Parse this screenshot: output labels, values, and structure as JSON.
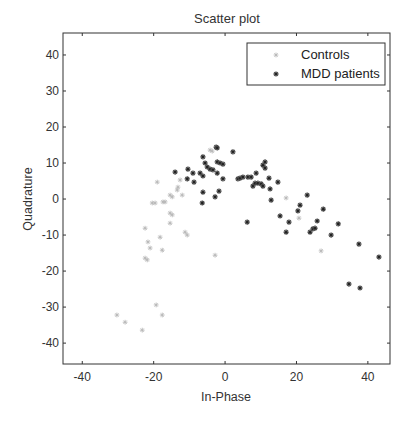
{
  "chart_data": {
    "type": "scatter",
    "title": "Scatter plot",
    "xlabel": "In-Phase",
    "ylabel": "Quadrature",
    "xlim": [
      -45.4,
      46.2
    ],
    "ylim": [
      -45.8,
      46.1
    ],
    "xticks": [
      -40,
      -20,
      0,
      20,
      40
    ],
    "yticks": [
      40,
      30,
      20,
      10,
      0,
      -10,
      -20,
      -30,
      -40
    ],
    "grid": false,
    "legend_position": "upper right",
    "series": [
      {
        "name": "Controls",
        "marker": "light-gray-star",
        "color": "#b8b8b8",
        "points": [
          [
            -19.0,
            4.7
          ],
          [
            -12.6,
            5.3
          ],
          [
            -13.2,
            3.3
          ],
          [
            -13.4,
            2.5
          ],
          [
            -15.4,
            1.1
          ],
          [
            -14.8,
            0.6
          ],
          [
            -12.0,
            1.1
          ],
          [
            -17.4,
            -0.8
          ],
          [
            -20.4,
            -1.1
          ],
          [
            -19.6,
            -1.1
          ],
          [
            -16.8,
            -0.8
          ],
          [
            -15.4,
            -3.9
          ],
          [
            -14.8,
            -4.4
          ],
          [
            -15.4,
            -6.7
          ],
          [
            -22.4,
            -8.1
          ],
          [
            -18.2,
            -10.6
          ],
          [
            -11.2,
            -9.2
          ],
          [
            -10.6,
            -10.0
          ],
          [
            -21.6,
            -11.9
          ],
          [
            -21.0,
            -13.6
          ],
          [
            -17.6,
            -14.2
          ],
          [
            -22.4,
            -16.4
          ],
          [
            -21.8,
            -16.9
          ],
          [
            -19.3,
            -29.4
          ],
          [
            -17.6,
            -32.2
          ],
          [
            -30.3,
            -32.2
          ],
          [
            -28.0,
            -34.2
          ],
          [
            -23.2,
            -36.4
          ],
          [
            -2.8,
            -15.6
          ],
          [
            -4.2,
            13.6
          ],
          [
            -3.6,
            13.3
          ],
          [
            17.1,
            0.3
          ],
          [
            20.7,
            -5.3
          ],
          [
            26.9,
            -14.4
          ]
        ]
      },
      {
        "name": "MDD patients",
        "marker": "dark-gray-star",
        "color": "#4a4a4a",
        "points": [
          [
            -14.0,
            7.5
          ],
          [
            -10.4,
            8.3
          ],
          [
            -10.6,
            5.6
          ],
          [
            -9.0,
            7.2
          ],
          [
            -8.7,
            4.7
          ],
          [
            -7.0,
            7.2
          ],
          [
            -6.2,
            6.4
          ],
          [
            -6.2,
            11.7
          ],
          [
            -5.6,
            10.0
          ],
          [
            -5.0,
            8.9
          ],
          [
            -4.2,
            8.3
          ],
          [
            -3.4,
            8.1
          ],
          [
            -2.5,
            14.4
          ],
          [
            -2.2,
            14.2
          ],
          [
            -2.2,
            10.3
          ],
          [
            -1.4,
            10.0
          ],
          [
            -0.6,
            9.7
          ],
          [
            -2.2,
            7.2
          ],
          [
            -0.6,
            5.6
          ],
          [
            -6.2,
            1.9
          ],
          [
            -1.7,
            2.2
          ],
          [
            -2.8,
            0.6
          ],
          [
            -6.4,
            -1.1
          ],
          [
            2.2,
            13.1
          ],
          [
            3.6,
            5.6
          ],
          [
            4.2,
            5.8
          ],
          [
            5.0,
            6.1
          ],
          [
            6.4,
            6.1
          ],
          [
            7.3,
            6.1
          ],
          [
            7.8,
            3.6
          ],
          [
            8.4,
            4.4
          ],
          [
            9.2,
            4.4
          ],
          [
            10.1,
            4.2
          ],
          [
            10.6,
            3.6
          ],
          [
            8.7,
            7.2
          ],
          [
            10.6,
            9.4
          ],
          [
            11.2,
            10.3
          ],
          [
            11.2,
            8.6
          ],
          [
            12.3,
            5.8
          ],
          [
            12.6,
            2.8
          ],
          [
            14.8,
            4.7
          ],
          [
            12.9,
            -0.3
          ],
          [
            6.2,
            -6.4
          ],
          [
            15.4,
            -4.7
          ],
          [
            17.9,
            -6.4
          ],
          [
            17.1,
            -9.2
          ],
          [
            20.4,
            -3.3
          ],
          [
            21.0,
            -1.7
          ],
          [
            23.0,
            1.1
          ],
          [
            23.8,
            -9.2
          ],
          [
            24.6,
            -8.3
          ],
          [
            25.2,
            -8.1
          ],
          [
            25.8,
            -6.1
          ],
          [
            27.5,
            -2.8
          ],
          [
            31.7,
            -6.9
          ],
          [
            29.7,
            -10.0
          ],
          [
            37.5,
            -12.5
          ],
          [
            43.1,
            -16.1
          ],
          [
            34.7,
            -23.6
          ],
          [
            37.8,
            -24.7
          ]
        ]
      }
    ]
  },
  "labels": {
    "title": "Scatter plot",
    "xlabel": "In-Phase",
    "ylabel": "Quadrature",
    "legend": [
      "Controls",
      "MDD patients"
    ]
  }
}
